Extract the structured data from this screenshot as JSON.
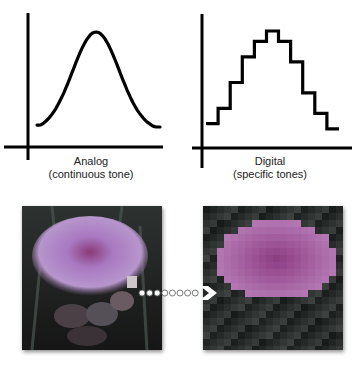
{
  "charts": [
    {
      "id": "analog",
      "title": "Analog",
      "subtitle": "(continuous tone)",
      "type": "line",
      "curve": "bell",
      "x": [
        0,
        0.1,
        0.2,
        0.3,
        0.4,
        0.5,
        0.6,
        0.7,
        0.8,
        0.9,
        1.0
      ],
      "y": [
        0.05,
        0.1,
        0.25,
        0.6,
        0.92,
        1.0,
        0.92,
        0.6,
        0.25,
        0.08,
        0.03
      ]
    },
    {
      "id": "digital",
      "title": "Digital",
      "subtitle": "(specific tones)",
      "type": "step",
      "levels": [
        0.1,
        0.25,
        0.5,
        0.75,
        0.9,
        1.0,
        0.9,
        0.7,
        0.4,
        0.2,
        0.05
      ]
    }
  ],
  "chart_data": [
    {
      "type": "line",
      "title": "Analog",
      "xlabel": "(continuous tone)",
      "ylabel": "",
      "x": [
        0,
        0.1,
        0.2,
        0.3,
        0.4,
        0.5,
        0.6,
        0.7,
        0.8,
        0.9,
        1.0
      ],
      "values": [
        0.05,
        0.1,
        0.25,
        0.6,
        0.92,
        1.0,
        0.92,
        0.6,
        0.25,
        0.08,
        0.03
      ]
    },
    {
      "type": "line",
      "title": "Digital",
      "xlabel": "(specific tones)",
      "ylabel": "",
      "step": true,
      "values": [
        0.1,
        0.25,
        0.5,
        0.75,
        0.9,
        1.0,
        0.9,
        0.7,
        0.4,
        0.2,
        0.05
      ]
    }
  ],
  "photos": {
    "left": {
      "name": "artichoke-flower-continuous",
      "tint": "#a27ab8"
    },
    "right": {
      "name": "artichoke-flower-pixelated",
      "tint": "#a070b8"
    }
  },
  "connector": {
    "dot_count": 8,
    "arrow": "chevron-right"
  },
  "colors": {
    "line": "#000000",
    "background": "#ffffff",
    "dark": "#1c1c1e"
  }
}
